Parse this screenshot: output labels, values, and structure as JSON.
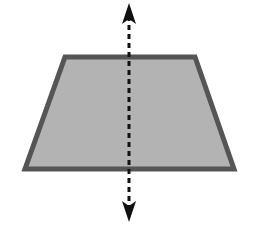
{
  "figure": {
    "trapezoid": {
      "points": "65,57 195,57 234,169 25,169",
      "fill": "#b3b3b3",
      "stroke": "#555555",
      "stroke_width": 5
    },
    "symmetry_line": {
      "x": 129,
      "y_top": 10,
      "y_bottom": 218,
      "color": "#111111",
      "dash": "5,4",
      "arrows": "both"
    }
  }
}
